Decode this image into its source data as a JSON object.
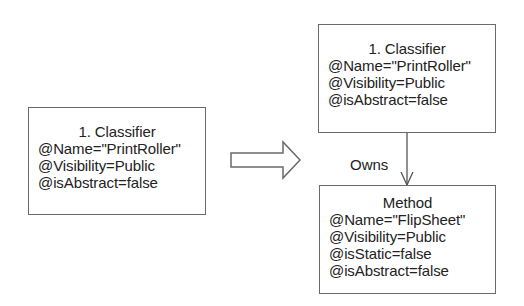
{
  "diagram": {
    "source_classifier": {
      "title": "1. Classifier",
      "attributes": [
        "@Name=\"PrintRoller\"",
        "@Visibility=Public",
        "@isAbstract=false"
      ]
    },
    "transform_arrow": {
      "style": "hollow-block-arrow",
      "direction": "right"
    },
    "target_classifier": {
      "title": "1. Classifier",
      "attributes": [
        "@Name=\"PrintRoller\"",
        "@Visibility=Public",
        "@isAbstract=false"
      ]
    },
    "relation": {
      "label": "Owns",
      "style": "open-arrow",
      "direction": "down"
    },
    "method": {
      "title": "Method",
      "attributes": [
        "@Name=\"FlipSheet\"",
        "@Visibility=Public",
        "@isStatic=false",
        "@isAbstract=false"
      ]
    },
    "colors": {
      "stroke": "#6a6a6a",
      "text": "#222222",
      "background": "#ffffff"
    }
  }
}
